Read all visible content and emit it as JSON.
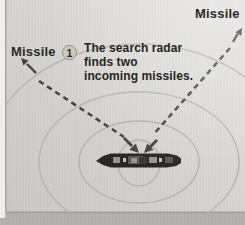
{
  "figure": {
    "labels": {
      "missile_left": "Missile",
      "missile_right": "Missile"
    },
    "step_badge": {
      "number": "1"
    },
    "caption": {
      "line1": "The search radar",
      "line2": "finds two",
      "line3": "incoming missiles."
    },
    "colors": {
      "photo_bg_dark": "#c9c7c3",
      "photo_bg_light": "#e3e2df",
      "page_margin": "#f0efec",
      "bottom_band": "#b1afac",
      "ring": "#b5b2a8",
      "dash": "#3f3e3c",
      "arrow": "#45403a",
      "ship_hull": "#23221f",
      "ink": "#2b2a26"
    }
  }
}
